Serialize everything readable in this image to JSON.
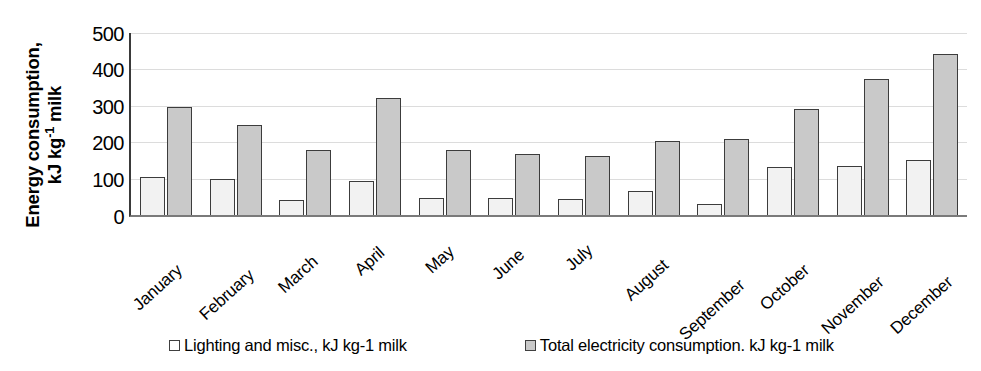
{
  "chart_data": {
    "type": "bar",
    "title": "",
    "xlabel": "",
    "ylabel": "Energy consumption, kJ kg-1 milk",
    "ylabel_line1": "Energy consumption,",
    "ylabel_line2_pre": "kJ kg",
    "ylabel_line2_sup": "-1",
    "ylabel_line2_post": " milk",
    "ylim": [
      0,
      500
    ],
    "yticks": [
      500,
      400,
      300,
      200,
      100,
      0
    ],
    "grid": true,
    "legend_position": "bottom",
    "categories": [
      "January",
      "February",
      "March",
      "April",
      "May",
      "June",
      "July",
      "August",
      "September",
      "October",
      "November",
      "December"
    ],
    "series": [
      {
        "name": "Lighting and misc., kJ kg-1 milk",
        "color": "#f2f2f2",
        "values": [
          105,
          98,
          40,
          93,
          48,
          47,
          43,
          65,
          30,
          133,
          136,
          150
        ]
      },
      {
        "name": "Total electricity consumption. kJ kg-1 milk",
        "color": "#c9c9c9",
        "values": [
          298,
          247,
          178,
          322,
          178,
          168,
          163,
          202,
          210,
          290,
          375,
          443
        ]
      }
    ]
  },
  "legend": {
    "items": [
      {
        "label": "Lighting and misc., kJ kg-1 milk",
        "swatch": "s1"
      },
      {
        "label": "Total electricity consumption. kJ kg-1 milk",
        "swatch": "s2"
      }
    ]
  }
}
